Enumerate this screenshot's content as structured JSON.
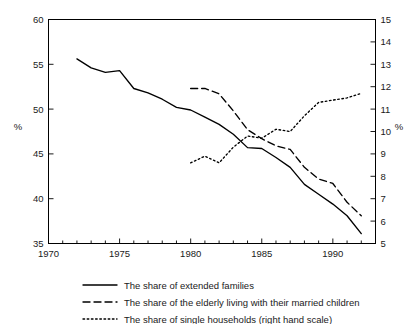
{
  "chart_data": {
    "type": "line",
    "title": "",
    "subtitle": "",
    "xlabel": "",
    "ylabel": "%",
    "ylabel_right": "%",
    "xlim": [
      1970,
      1993
    ],
    "ylim": [
      35,
      60
    ],
    "ylim_right": [
      5,
      15
    ],
    "grid": false,
    "legend_position": "bottom",
    "x_ticks_major": [
      1970,
      1975,
      1980,
      1985,
      1990
    ],
    "x_tick_labels": [
      "1970",
      "1975",
      "1980",
      "1985",
      "1990"
    ],
    "x_ticks_minor": [
      1971,
      1972,
      1973,
      1974,
      1976,
      1977,
      1978,
      1979,
      1981,
      1982,
      1983,
      1984,
      1986,
      1987,
      1988,
      1989,
      1991,
      1992,
      1993
    ],
    "y_ticks_left": [
      35,
      40,
      45,
      50,
      55,
      60
    ],
    "y_tick_labels_left": [
      "35",
      "40",
      "45",
      "50",
      "55",
      "60"
    ],
    "y_ticks_right": [
      5,
      6,
      7,
      8,
      9,
      10,
      11,
      12,
      13,
      14,
      15
    ],
    "y_tick_labels_right": [
      "5",
      "6",
      "7",
      "8",
      "9",
      "10",
      "11",
      "12",
      "13",
      "14",
      "15"
    ],
    "series": [
      {
        "name": "The share of extended families",
        "axis": "left",
        "style": "solid",
        "x": [
          1972,
          1973,
          1974,
          1975,
          1976,
          1977,
          1978,
          1979,
          1980,
          1981,
          1982,
          1983,
          1984,
          1985,
          1986,
          1987,
          1988,
          1989,
          1990,
          1991,
          1992
        ],
        "values": [
          55.6,
          54.6,
          54.1,
          54.3,
          52.3,
          51.8,
          51.1,
          50.2,
          49.9,
          49.1,
          48.3,
          47.2,
          45.7,
          45.6,
          44.6,
          43.5,
          41.6,
          40.5,
          39.4,
          38.1,
          36.1
        ]
      },
      {
        "name": "The share of the elderly living with their married children",
        "axis": "left",
        "style": "dashed",
        "x": [
          1980,
          1981,
          1982,
          1983,
          1984,
          1985,
          1986,
          1987,
          1988,
          1989,
          1990,
          1991,
          1992
        ],
        "values": [
          52.3,
          52.3,
          51.7,
          49.8,
          47.7,
          46.7,
          45.9,
          45.5,
          43.5,
          42.2,
          41.7,
          39.6,
          38.1
        ]
      },
      {
        "name": "The share of single households (right hand scale)",
        "axis": "right",
        "style": "dotted",
        "x": [
          1980,
          1981,
          1982,
          1983,
          1984,
          1985,
          1986,
          1987,
          1988,
          1989,
          1990,
          1991,
          1992
        ],
        "values": [
          8.6,
          8.9,
          8.6,
          9.3,
          9.8,
          9.7,
          10.1,
          10.0,
          10.7,
          11.3,
          11.4,
          11.5,
          11.7
        ]
      }
    ],
    "legend": [
      {
        "label": "The share of extended families",
        "style": "solid"
      },
      {
        "label": "The share of the elderly living with their married children",
        "style": "dashed"
      },
      {
        "label": "The share of single households (right hand scale)",
        "style": "dotted"
      }
    ],
    "colors": {
      "line": "#000000",
      "axis": "#000000",
      "background": "#ffffff",
      "text": "#1a1a1a"
    }
  }
}
